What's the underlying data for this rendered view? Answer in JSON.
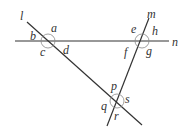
{
  "diagram": {
    "lines": [
      {
        "name": "l",
        "x1": 27,
        "y1": 22,
        "x2": 142,
        "y2": 125
      },
      {
        "name": "n",
        "x1": 15,
        "y1": 41,
        "x2": 169,
        "y2": 41
      },
      {
        "name": "m",
        "x1": 149,
        "y1": 18,
        "x2": 107,
        "y2": 126
      }
    ],
    "line_labels": {
      "l": {
        "text": "l",
        "x": 20,
        "y": 20
      },
      "m": {
        "text": "m",
        "x": 147,
        "y": 18
      },
      "n": {
        "text": "n",
        "x": 172,
        "y": 46
      }
    },
    "intersections": [
      {
        "name": "l-n",
        "cx": 48,
        "cy": 41,
        "r": 7
      },
      {
        "name": "m-n",
        "cx": 142,
        "cy": 41,
        "r": 7
      },
      {
        "name": "l-m",
        "cx": 117,
        "cy": 101,
        "r": 7
      }
    ],
    "angle_labels": {
      "a": {
        "text": "a",
        "x": 51,
        "y": 32
      },
      "b": {
        "text": "b",
        "x": 30,
        "y": 40
      },
      "c": {
        "text": "c",
        "x": 40,
        "y": 56
      },
      "d": {
        "text": "d",
        "x": 63,
        "y": 54
      },
      "e": {
        "text": "e",
        "x": 131,
        "y": 33
      },
      "h": {
        "text": "h",
        "x": 152,
        "y": 35
      },
      "f": {
        "text": "f",
        "x": 124,
        "y": 56
      },
      "g": {
        "text": "g",
        "x": 146,
        "y": 55
      },
      "p": {
        "text": "p",
        "x": 111,
        "y": 90
      },
      "s": {
        "text": "s",
        "x": 125,
        "y": 103
      },
      "q": {
        "text": "q",
        "x": 101,
        "y": 110
      },
      "r": {
        "text": "r",
        "x": 114,
        "y": 120
      }
    }
  }
}
